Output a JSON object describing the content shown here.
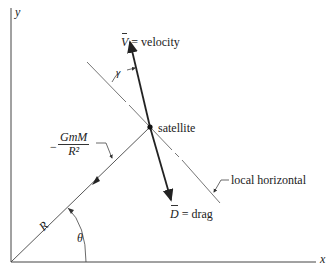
{
  "diagram": {
    "axes": {
      "x_label": "x",
      "y_label": "y"
    },
    "velocity": {
      "symbol": "V",
      "label": "= velocity"
    },
    "drag": {
      "symbol": "D",
      "label": "= drag"
    },
    "satellite_label": "satellite",
    "local_horizontal_label": "local horizontal",
    "gamma_label": "γ",
    "theta_label": "θ",
    "radius_label": "R",
    "gravity": {
      "sign": "−",
      "numerator": "GmM",
      "denominator": "R²"
    }
  },
  "colors": {
    "line": "#333333",
    "background": "#ffffff"
  }
}
